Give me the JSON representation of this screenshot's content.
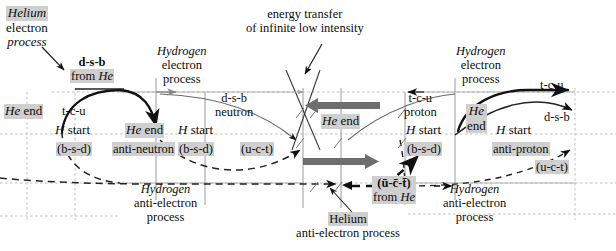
{
  "diagram": {
    "colors": {
      "ink": "#0d0d0d",
      "highlight": "#cfcfcf",
      "grid": "#c9b9b3",
      "thick_arrow": "#6e6e6e",
      "faint_line": "#8d8d8d",
      "bleed_text": "#dedbd6"
    },
    "labels": {
      "helium_electron_process": {
        "line1": "Helium",
        "line2": "electron",
        "line3": "process"
      },
      "hydrogen_electron_process_left": {
        "line1": "Hydrogen",
        "line2": "electron",
        "line3": "process"
      },
      "hydrogen_electron_process_right": {
        "line1": "Hydrogen",
        "line2": "electron",
        "line3": "process"
      },
      "hydrogen_anti_electron_process_left": {
        "line1": "Hydrogen",
        "line2": "anti-electron",
        "line3": "process"
      },
      "hydrogen_anti_electron_process_right": {
        "line1": "Hydrogen",
        "line2": "anti-electron",
        "line3": "process"
      },
      "helium_anti_electron_process": {
        "line1": "Helium",
        "line2": "anti-electron process"
      },
      "energy_transfer": {
        "line1": "energy transfer",
        "line2": "of infinite low intensity"
      },
      "dsb_from_he": {
        "top": "d-s-b",
        "bottom": "from He"
      },
      "uct_bar_from_he": {
        "top": "(ū-c̄-t̄)",
        "bottom": "from He"
      },
      "he_end_1": "He end",
      "he_end_2": "He end",
      "he_end_3": "He end",
      "he_end_4_line1": "He",
      "he_end_4_line2": "end",
      "h_start_1": "H start",
      "h_start_2": "H start",
      "h_start_3": "H start",
      "tcu_1": "t-c-u",
      "tcu_2": "t-c-u",
      "tcu_3": "t-c-u",
      "dsb_1": "d-s-b",
      "dsb_2": "d-s-b",
      "bsd_1": "(b-s-d)",
      "bsd_2": "(b-s-d)",
      "bsd_3": "(b-s-d)",
      "uct_1": "(u-c-t)",
      "uct_2": "(u-c-t)",
      "anti_neutron": "anti-neutron",
      "neutron": "neutron",
      "proton": "proton",
      "anti_proton": "anti-proton"
    },
    "bleed": {
      "top_left": "",
      "top_mid": "",
      "mid": ""
    }
  }
}
